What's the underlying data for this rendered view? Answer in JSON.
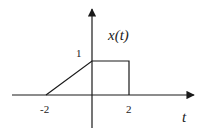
{
  "diagram": {
    "title": "x(t)",
    "signal_label": "x(t)",
    "x_axis_label": "t",
    "y_tick_label": "1",
    "x_tick_labels": [
      "-2",
      "2"
    ],
    "line_color": "#1a1a1a",
    "points": [
      {
        "t": -2,
        "x": 0
      },
      {
        "t": 0,
        "x": 1
      },
      {
        "t": 2,
        "x": 1
      },
      {
        "t": 2,
        "x": 0
      }
    ]
  }
}
